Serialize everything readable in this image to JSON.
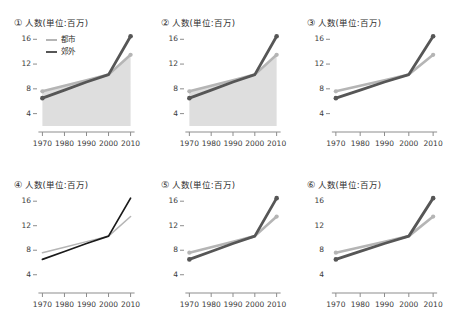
{
  "figure": {
    "background": "#ffffff",
    "panel_count": 6,
    "grid": "2 rows x 3 columns"
  },
  "colors": {
    "city_line": "#b5b5b5",
    "suburb_line": "#565656",
    "suburb_line_dark": "#1a1a1a",
    "fill": "#dedede",
    "axis": "#8d8d8d",
    "text": "#2e2e2e"
  },
  "series_labels": {
    "city": "都市",
    "suburb": "郊外"
  },
  "axis": {
    "y_ticks": [
      "16",
      "12",
      "8",
      "4"
    ],
    "x_ticks": [
      "1970",
      "1980",
      "1990",
      "2000",
      "2010"
    ],
    "y_title": "人数(単位:百万)"
  },
  "panels": [
    {
      "number": "①",
      "title": "人数(単位:百万)",
      "has_legend": true,
      "has_fill": true,
      "has_markers": true,
      "has_y_spine": true,
      "has_x_spine": true,
      "line_weight": "thick",
      "suburb_color_key": "suburb_line"
    },
    {
      "number": "②",
      "title": "人数(単位:百万)",
      "has_legend": false,
      "has_fill": true,
      "has_markers": true,
      "has_y_spine": true,
      "has_x_spine": true,
      "line_weight": "thick",
      "suburb_color_key": "suburb_line"
    },
    {
      "number": "③",
      "title": "人数(単位:百万)",
      "has_legend": false,
      "has_fill": false,
      "has_markers": true,
      "has_y_spine": true,
      "has_x_spine": true,
      "line_weight": "thick",
      "suburb_color_key": "suburb_line"
    },
    {
      "number": "④",
      "title": "人数(単位:百万)",
      "has_legend": false,
      "has_fill": false,
      "has_markers": false,
      "has_y_spine": true,
      "has_x_spine": true,
      "line_weight": "thin",
      "suburb_color_key": "suburb_line_dark"
    },
    {
      "number": "⑤",
      "title": "人数(単位:百万)",
      "has_legend": false,
      "has_fill": false,
      "has_markers": true,
      "has_y_spine": true,
      "has_x_spine": true,
      "line_weight": "thick",
      "suburb_color_key": "suburb_line"
    },
    {
      "number": "⑥",
      "title": "人数(単位:百万)",
      "has_legend": false,
      "has_fill": false,
      "has_markers": true,
      "has_y_spine": false,
      "has_x_spine": true,
      "line_weight": "thick",
      "suburb_color_key": "suburb_line"
    }
  ],
  "chart_data": {
    "type": "line",
    "title": "人数(単位:百万)",
    "xlabel": "",
    "ylabel": "人数(単位:百万)",
    "x": [
      1970,
      1980,
      1990,
      2000,
      2010
    ],
    "xlim": [
      1968,
      2012
    ],
    "ylim": [
      2,
      17.5
    ],
    "y_ticks": [
      4,
      8,
      12,
      16
    ],
    "x_ticks": [
      1970,
      1980,
      1990,
      2000,
      2010
    ],
    "grid": false,
    "legend": "inside top-left (panel ① only)",
    "series": [
      {
        "name": "都市",
        "values": [
          7.6,
          8.5,
          9.4,
          10.3,
          13.5
        ]
      },
      {
        "name": "郊外",
        "values": [
          6.5,
          7.8,
          9.1,
          10.3,
          16.5
        ]
      }
    ],
    "repeated_in_panels": 6
  }
}
